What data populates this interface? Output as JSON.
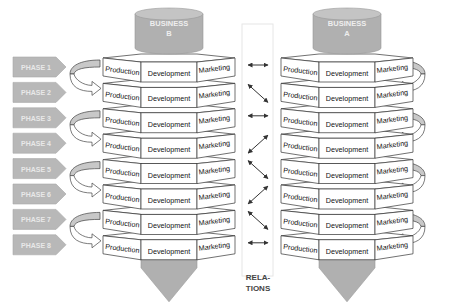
{
  "phases": [
    "PHASE 1",
    "PHASE 2",
    "PHASE 3",
    "PHASE 4",
    "PHASE 5",
    "PHASE 6",
    "PHASE 7",
    "PHASE 8"
  ],
  "left_stack": {
    "title_line1": "BUSINESS",
    "title_line2": "B",
    "layer_labels": {
      "left": "Production",
      "center": "Development",
      "right": "Marketing"
    }
  },
  "right_stack": {
    "title_line1": "BUSINESS",
    "title_line2": "A",
    "layer_labels": {
      "left": "Production",
      "center": "Development",
      "right": "Marketing"
    }
  },
  "relations": {
    "label_line1": "RELA-",
    "label_line2": "TIONS",
    "arrows": [
      "horizontal",
      "diag-down",
      "horizontal",
      "diag-up",
      "diag-down",
      "diag-up",
      "diag-down",
      "horizontal"
    ]
  },
  "colors": {
    "phase_fill": "#b8b8b8",
    "phase_text": "#e8e8e8",
    "cylinder_fill": "#b0b0b0",
    "layer_fill": "#ffffff",
    "stroke": "#333333",
    "curl_fill": "#c8c8c8",
    "bottom_arrow": "#b0b0b0"
  }
}
